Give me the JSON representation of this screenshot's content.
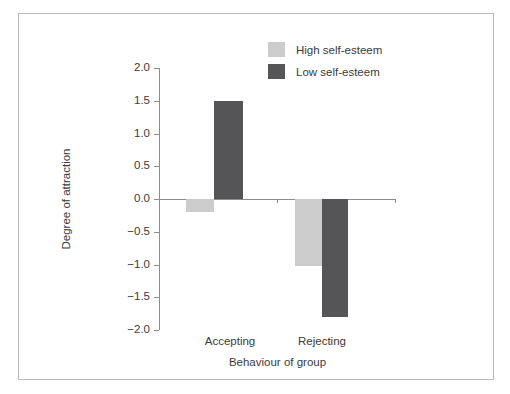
{
  "chart_data": {
    "type": "bar",
    "title": "",
    "xlabel": "Behaviour of group",
    "ylabel": "Degree of attraction",
    "categories": [
      "Accepting",
      "Rejecting"
    ],
    "series": [
      {
        "name": "High self-esteem",
        "color": "#cccccc",
        "values": [
          -0.2,
          -1.02
        ]
      },
      {
        "name": "Low self-esteem",
        "color": "#555557",
        "values": [
          1.5,
          -1.8
        ]
      }
    ],
    "ylim": [
      -2.0,
      2.0
    ],
    "ytick_labels": [
      "2.0",
      "1.5",
      "1.0",
      "0.5",
      "0.0",
      "−0.5",
      "−1.0",
      "−1.5",
      "−2.0"
    ],
    "ytick_values": [
      2.0,
      1.5,
      1.0,
      0.5,
      0.0,
      -0.5,
      -1.0,
      -1.5,
      -2.0
    ],
    "grid": false,
    "legend_position": "top-center",
    "legend_entries": [
      "High self-esteem",
      "Low self-esteem"
    ]
  }
}
